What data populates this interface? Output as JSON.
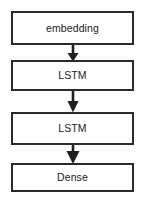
{
  "diagram": {
    "orientation": "vertical-top-to-bottom",
    "background_color": "#fdfdfd",
    "box_border_color": "#2b2b2b",
    "box_fill_color": "#ffffff",
    "arrow_color": "#1f1f1f",
    "nodes": [
      {
        "id": "embedding",
        "label": "embedding",
        "x": 11,
        "y": 11,
        "width": 123,
        "height": 34
      },
      {
        "id": "lstm-1",
        "label": "LSTM",
        "x": 11,
        "y": 60,
        "width": 123,
        "height": 31
      },
      {
        "id": "lstm-2",
        "label": "LSTM",
        "x": 11,
        "y": 112,
        "width": 123,
        "height": 33
      },
      {
        "id": "dense",
        "label": "Dense",
        "x": 11,
        "y": 163,
        "width": 123,
        "height": 29
      }
    ],
    "edges": [
      {
        "id": "edge-embedding-lstm1",
        "from": "embedding",
        "to": "lstm-1",
        "x": 73,
        "y_start": 45,
        "y_end": 60
      },
      {
        "id": "edge-lstm1-lstm2",
        "from": "lstm-1",
        "to": "lstm-2",
        "x": 73,
        "y_start": 91,
        "y_end": 112
      },
      {
        "id": "edge-lstm2-dense",
        "from": "lstm-2",
        "to": "dense",
        "x": 73,
        "y_start": 145,
        "y_end": 163
      }
    ]
  }
}
